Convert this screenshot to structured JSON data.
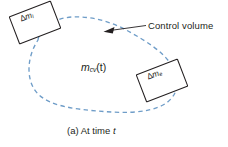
{
  "figure": {
    "caption_prefix": "(a) At time ",
    "caption_italic": "t",
    "annotation_label": "Control volume",
    "cv_mass_symbol": "m",
    "cv_mass_subscript": "cv",
    "cv_mass_argument": "(t)",
    "inlet_box": {
      "delta": "Δ",
      "symbol": "m",
      "subscript": "i"
    },
    "exit_box": {
      "delta": "Δ",
      "symbol": "m",
      "subscript": "e"
    },
    "colors": {
      "boundary": "#6f9dc8",
      "ink": "#231f20",
      "background": "#ffffff"
    }
  }
}
